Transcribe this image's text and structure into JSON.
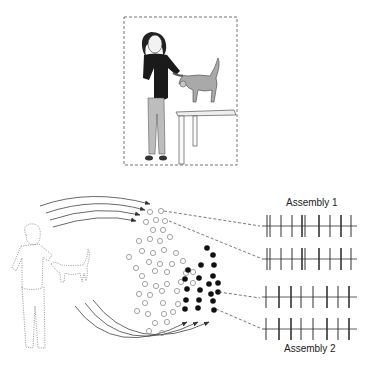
{
  "figure": {
    "colors": {
      "stroke": "#555555",
      "dotted_outline": "#888888",
      "open_neuron": "#9a9a9a",
      "filled_neuron": "#111111",
      "shirt": "#1a1a1a",
      "pants": "#bcbcbc",
      "cat": "#a8a8a8"
    },
    "labels": {
      "assembly_1": "Assembly 1",
      "assembly_2": "Assembly 2"
    },
    "scene": {
      "frame": "dashed",
      "subjects": [
        "woman",
        "cat",
        "table"
      ]
    },
    "spike_trains": [
      {
        "assembly": 1,
        "spikes": [
          0,
          3,
          14,
          25,
          35,
          38,
          55,
          66,
          77,
          80,
          91
        ]
      },
      {
        "assembly": 1,
        "spikes": [
          0,
          3,
          14,
          25,
          35,
          38,
          55,
          66,
          77,
          80,
          91
        ]
      },
      {
        "assembly": 2,
        "spikes": [
          0,
          13,
          25,
          35,
          47,
          61,
          72,
          84
        ]
      },
      {
        "assembly": 2,
        "spikes": [
          0,
          13,
          25,
          35,
          47,
          61,
          72,
          84
        ]
      }
    ]
  }
}
